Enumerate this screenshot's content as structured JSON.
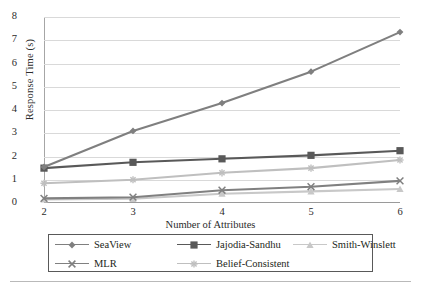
{
  "chart_data": {
    "type": "line",
    "title": "",
    "xlabel": "Number of Attributes",
    "ylabel": "Response Time (s)",
    "x": [
      2,
      3,
      4,
      5,
      6
    ],
    "xticklabels": [
      "2",
      "3",
      "4",
      "5",
      "6"
    ],
    "yticklabels": [
      "0",
      "1",
      "2",
      "3",
      "4",
      "5",
      "6",
      "7",
      "8"
    ],
    "ylim": [
      0,
      8
    ],
    "xlim": [
      2,
      6
    ],
    "grid": "horizontal",
    "legend_position": "below-plot",
    "series": [
      {
        "name": "SeaView",
        "values": [
          1.55,
          3.1,
          4.3,
          5.65,
          7.35
        ],
        "color": "#7f7f7f",
        "marker": "diamond"
      },
      {
        "name": "Jajodia-Sandhu",
        "values": [
          1.5,
          1.75,
          1.9,
          2.05,
          2.25
        ],
        "color": "#595959",
        "marker": "square"
      },
      {
        "name": "Smith-Winslett",
        "values": [
          0.15,
          0.18,
          0.4,
          0.5,
          0.6
        ],
        "color": "#c8c8c8",
        "marker": "triangle"
      },
      {
        "name": "MLR",
        "values": [
          0.2,
          0.25,
          0.55,
          0.7,
          0.95
        ],
        "color": "#808080",
        "marker": "x"
      },
      {
        "name": "Belief-Consistent",
        "values": [
          0.85,
          1.0,
          1.3,
          1.5,
          1.85
        ],
        "color": "#bfbfbf",
        "marker": "star"
      }
    ]
  },
  "legend": {
    "rows": [
      [
        "SeaView",
        "Jajodia-Sandhu",
        "Smith-Winslett"
      ],
      [
        "MLR",
        "Belief-Consistent"
      ]
    ]
  }
}
